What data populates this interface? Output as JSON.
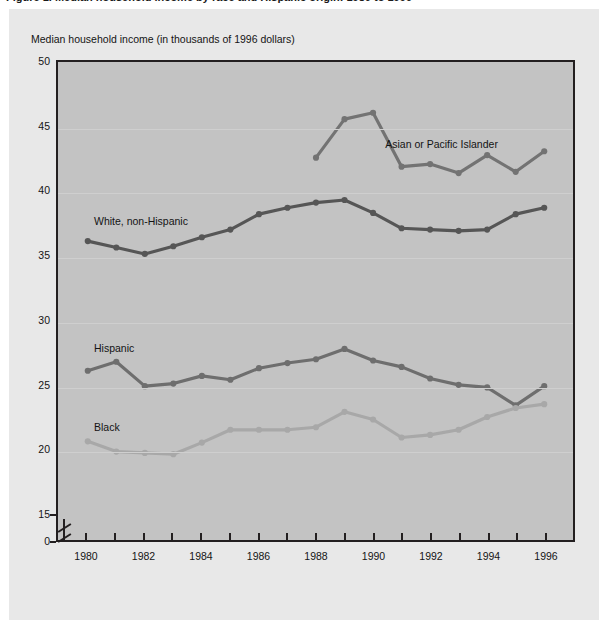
{
  "figure": {
    "caption_cutoff": "Figure 1. Median household income by race and Hispanic origin: 1980 to 1996",
    "panel_bg": "#e8e8e8",
    "plot_bg": "#c3c3c3",
    "frame_color": "#231f20"
  },
  "axis_title": "Median household income (in thousands of 1996 dollars)",
  "series_labels": {
    "asian": "Asian or Pacific Islander",
    "white": "White, non-Hispanic",
    "hispanic": "Hispanic",
    "black": "Black"
  },
  "chart_data": {
    "type": "line",
    "title": "Median household income (in thousands of 1996 dollars)",
    "xlabel": "",
    "ylabel": "Median household income (in thousands of 1996 dollars)",
    "xlim": [
      1979.4,
      1996.6
    ],
    "ylim": [
      14.2,
      50
    ],
    "ylim_break": {
      "below": 14.2,
      "shown_zero_tick": 0
    },
    "grid": true,
    "legend": "inline-labels",
    "x": [
      1980,
      1981,
      1982,
      1983,
      1984,
      1985,
      1986,
      1987,
      1988,
      1989,
      1990,
      1991,
      1992,
      1993,
      1994,
      1995,
      1996
    ],
    "y_ticks": [
      0,
      15,
      20,
      25,
      30,
      35,
      40,
      45,
      50
    ],
    "x_ticks": [
      1980,
      1981,
      1982,
      1983,
      1984,
      1985,
      1986,
      1987,
      1988,
      1989,
      1990,
      1991,
      1992,
      1993,
      1994,
      1995,
      1996
    ],
    "x_tick_labels": [
      "1980",
      "",
      "1982",
      "",
      "1984",
      "",
      "1986",
      "",
      "1988",
      "",
      "1990",
      "",
      "1992",
      "",
      "1994",
      "",
      "1996"
    ],
    "series": [
      {
        "name": "Asian or Pacific Islander",
        "color": "#737373",
        "x": [
          1988,
          1989,
          1990,
          1991,
          1992,
          1993,
          1994,
          1995,
          1996
        ],
        "values": [
          42.7,
          45.7,
          46.2,
          42.0,
          42.2,
          41.5,
          42.9,
          41.6,
          43.2
        ]
      },
      {
        "name": "White, non-Hispanic",
        "color": "#565656",
        "x": [
          1980,
          1981,
          1982,
          1983,
          1984,
          1985,
          1986,
          1987,
          1988,
          1989,
          1990,
          1991,
          1992,
          1993,
          1994,
          1995,
          1996
        ],
        "values": [
          36.2,
          35.7,
          35.2,
          35.8,
          36.5,
          37.1,
          38.3,
          38.8,
          39.2,
          39.4,
          38.4,
          37.2,
          37.1,
          37.0,
          37.1,
          38.3,
          38.8
        ]
      },
      {
        "name": "Hispanic",
        "color": "#6e6e6e",
        "x": [
          1980,
          1981,
          1982,
          1983,
          1984,
          1985,
          1986,
          1987,
          1988,
          1989,
          1990,
          1991,
          1992,
          1993,
          1994,
          1995,
          1996
        ],
        "values": [
          26.1,
          26.8,
          24.9,
          25.1,
          25.7,
          25.4,
          26.3,
          26.7,
          27.0,
          27.8,
          26.9,
          26.4,
          25.5,
          25.0,
          24.8,
          23.4,
          24.9
        ]
      },
      {
        "name": "Black",
        "color": "#a8a8a8",
        "x": [
          1980,
          1981,
          1982,
          1983,
          1984,
          1985,
          1986,
          1987,
          1988,
          1989,
          1990,
          1991,
          1992,
          1993,
          1994,
          1995,
          1996
        ],
        "values": [
          20.6,
          19.8,
          19.7,
          19.6,
          20.5,
          21.5,
          21.5,
          21.5,
          21.7,
          22.9,
          22.3,
          20.9,
          21.1,
          21.5,
          22.5,
          23.2,
          23.5
        ]
      }
    ]
  }
}
